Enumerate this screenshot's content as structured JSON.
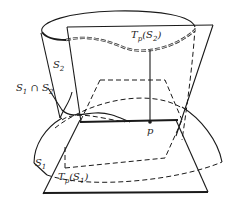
{
  "figure": {
    "labels": {
      "s2": {
        "base": "S",
        "sub": "2"
      },
      "intersection": {
        "base1": "S",
        "sub1": "1",
        "op": " ∩ ",
        "base2": "S",
        "sub2": "2"
      },
      "tp_s2": {
        "prefix": "T",
        "sub": "p",
        "arg_base": "(S",
        "arg_sub": "2",
        "close": ")"
      },
      "p": "p",
      "s1": {
        "base": "S",
        "sub": "1"
      },
      "tp_s1": {
        "prefix": "T",
        "sub": "p",
        "arg_base": "(S",
        "arg_sub": "1",
        "close": ")"
      }
    },
    "colors": {
      "stroke": "#1a1a1a",
      "background": "#ffffff"
    }
  }
}
